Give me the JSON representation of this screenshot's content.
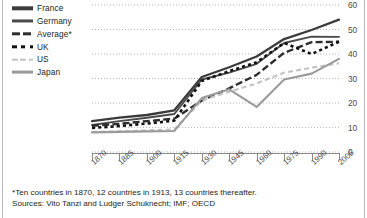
{
  "figure": {
    "footnote": "*Ten countries in 1870, 12 countries in 1913, 13 countries thereafter.",
    "sources": "Sources: Vito Tanzi and Ludger Schuknecht; IMF; OECD"
  },
  "legend": {
    "position": "top-left",
    "items": [
      {
        "label": "France",
        "style": "solid-thick",
        "color": "#3b3b3b"
      },
      {
        "label": "Germany",
        "style": "solid",
        "color": "#4a4a4a"
      },
      {
        "label": "Average*",
        "style": "dash-thick",
        "color": "#2e2e2e"
      },
      {
        "label": "UK",
        "style": "dot-square",
        "color": "#111111"
      },
      {
        "label": "US",
        "style": "dash-light",
        "color": "#c3c3c3"
      },
      {
        "label": "Japan",
        "style": "solid-gray",
        "color": "#9a9a9a"
      }
    ]
  },
  "chart_data": {
    "type": "line",
    "title": "",
    "subtitle": "",
    "xlabel": "",
    "ylabel": "",
    "grid": true,
    "x": [
      1870,
      1885,
      1900,
      1915,
      1930,
      1945,
      1960,
      1975,
      1990,
      2005
    ],
    "xticklabels": [
      "1870",
      "1885",
      "1900",
      "1915",
      "1930",
      "1945",
      "1960",
      "1975",
      "1990",
      "2005"
    ],
    "xlim": [
      1870,
      2005
    ],
    "ylim": [
      0,
      60
    ],
    "yticks": [
      0,
      10,
      20,
      30,
      40,
      50,
      60
    ],
    "yticklabels": [
      "0",
      "10",
      "20",
      "30",
      "40",
      "50",
      "60"
    ],
    "yaxis_position": "right",
    "series": [
      {
        "name": "France",
        "values": [
          12.6,
          14.0,
          15.1,
          17.0,
          30.6,
          34.6,
          39.0,
          46.1,
          49.8,
          54.0
        ]
      },
      {
        "name": "Germany",
        "values": [
          11.0,
          12.6,
          14.0,
          15.5,
          29.6,
          32.4,
          36.0,
          44.5,
          47.1,
          47.0
        ]
      },
      {
        "name": "Average*",
        "values": [
          10.7,
          11.5,
          12.6,
          13.6,
          21.0,
          26.0,
          31.5,
          40.5,
          44.8,
          45.0
        ]
      },
      {
        "name": "UK",
        "values": [
          9.8,
          10.6,
          11.6,
          12.8,
          29.0,
          33.0,
          36.6,
          44.5,
          40.0,
          45.0
        ]
      },
      {
        "name": "US",
        "values": [
          8.2,
          8.4,
          8.8,
          9.2,
          21.0,
          24.6,
          28.0,
          32.4,
          34.4,
          36.2
        ]
      },
      {
        "name": "Japan",
        "values": [
          8.0,
          8.2,
          8.4,
          8.6,
          22.0,
          25.6,
          18.4,
          29.6,
          32.0,
          38.0
        ]
      }
    ]
  }
}
